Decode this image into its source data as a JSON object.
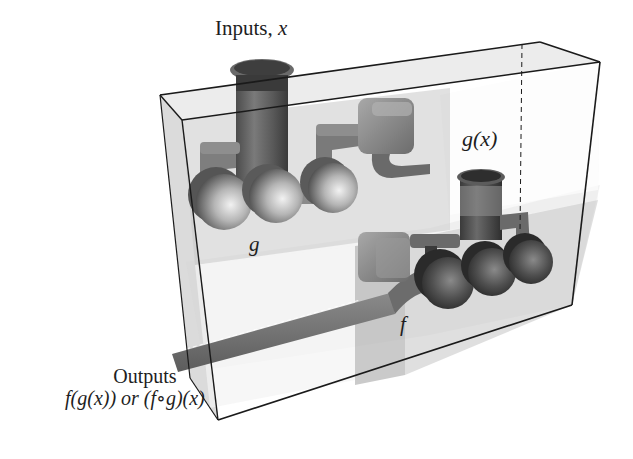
{
  "figure": {
    "type": "function-composition-machine",
    "labels": {
      "inputs_prefix": "Inputs, ",
      "inputs_var": "x",
      "inner_output": "g(x)",
      "inner_machine": "g",
      "outer_machine": "f",
      "outputs_title": "Outputs",
      "outputs_expr": "f(g(x)) or (f∘g)(x)"
    },
    "colors": {
      "box_edge": "#1a1a1a",
      "box_face": "#cfcfcf",
      "machine_g": "#9a9a9a",
      "machine_f": "#5e5e5e",
      "output_pipe": "#8c8c8c",
      "background": "#ffffff"
    }
  }
}
